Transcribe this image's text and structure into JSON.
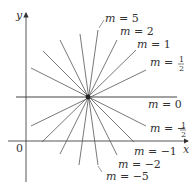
{
  "diagram": {
    "axes": {
      "x_label": "x",
      "y_label": "y",
      "origin_label": "0"
    },
    "center": {
      "x": 88,
      "y": 97
    },
    "lines": [
      {
        "slope_label": "m = 5",
        "m": "5",
        "x1": 79,
        "y1": 165,
        "x2": 98,
        "y2": 30
      },
      {
        "slope_label": "m = 2",
        "m": "2",
        "x1": 60,
        "y1": 154,
        "x2": 117,
        "y2": 40
      },
      {
        "slope_label": "m = 1",
        "m": "1",
        "x1": 42,
        "y1": 142,
        "x2": 136,
        "y2": 50
      },
      {
        "slope_label": "m = 1/2",
        "m": "1/2",
        "x1": 31,
        "y1": 126,
        "x2": 146,
        "y2": 70
      },
      {
        "slope_label": "m = 0",
        "m": "0",
        "x1": 16,
        "y1": 97,
        "x2": 177,
        "y2": 97
      },
      {
        "slope_label": "m = -1/2",
        "m": "-1/2",
        "x1": 31,
        "y1": 68,
        "x2": 146,
        "y2": 126
      },
      {
        "slope_label": "m = -1",
        "m": "-1",
        "x1": 43,
        "y1": 51,
        "x2": 134,
        "y2": 142
      },
      {
        "slope_label": "m = -2",
        "m": "-2",
        "x1": 60,
        "y1": 40,
        "x2": 117,
        "y2": 155
      },
      {
        "slope_label": "m = -5",
        "m": "-5",
        "x1": 80,
        "y1": 34,
        "x2": 98,
        "y2": 165
      }
    ],
    "labels": {
      "m5": {
        "var": "m",
        "eq": " = 5"
      },
      "m2": {
        "var": "m",
        "eq": " = 2"
      },
      "m1": {
        "var": "m",
        "eq": " = 1"
      },
      "mhalf": {
        "var": "m",
        "eq": " = ",
        "num": "1",
        "den": "2"
      },
      "m0": {
        "var": "m",
        "eq": " = 0"
      },
      "mneghalf": {
        "var": "m",
        "eq": " = −",
        "num": "1",
        "den": "2"
      },
      "mneg1": {
        "var": "m",
        "eq": " = −1"
      },
      "mneg2": {
        "var": "m",
        "eq": " = −2"
      },
      "mneg5": {
        "var": "m",
        "eq": " = −5"
      }
    },
    "colors": {
      "line": "#555555",
      "axis": "#444444",
      "text": "#333333"
    }
  }
}
